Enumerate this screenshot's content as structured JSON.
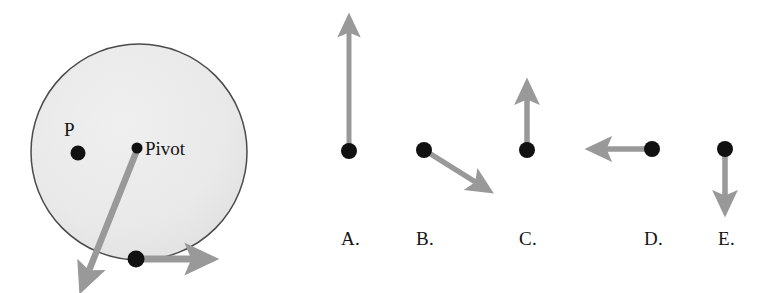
{
  "figure": {
    "type": "physics-rotation-diagram",
    "background_color": "#ffffff",
    "arrow_color": "#999999",
    "dot_color": "#111111",
    "disk": {
      "fill_color": "#eaeaea",
      "stroke_color": "#4a4a4a",
      "center_x": 139,
      "center_y": 152,
      "radius": 108
    },
    "labels": {
      "point_p": "P",
      "pivot": "Pivot"
    },
    "points": [
      {
        "name": "P",
        "x": 78,
        "y": 153
      },
      {
        "name": "Pivot",
        "x": 137,
        "y": 148
      },
      {
        "name": "rim-point",
        "x": 136,
        "y": 259
      }
    ],
    "vectors": [
      {
        "name": "rim-tangential-arrow",
        "x1": 139,
        "y1": 259,
        "x2": 212,
        "y2": 259,
        "direction": "right"
      },
      {
        "name": "pivot-diagonal-arrow",
        "x1": 137,
        "y1": 150,
        "x2": 84,
        "y2": 283,
        "direction": "down-left"
      }
    ]
  },
  "options": [
    {
      "label": "A.",
      "label_x": 341,
      "label_y": 229,
      "dot_x": 349,
      "dot_y": 151,
      "arrow": {
        "x1": 349,
        "y1": 145,
        "x2": 349,
        "y2": 14,
        "direction": "up"
      }
    },
    {
      "label": "B.",
      "label_x": 416,
      "label_y": 229,
      "dot_x": 424,
      "dot_y": 150,
      "arrow": {
        "x1": 429,
        "y1": 153,
        "x2": 494,
        "y2": 193,
        "direction": "down-right"
      }
    },
    {
      "label": "C.",
      "label_x": 519,
      "label_y": 229,
      "dot_x": 527,
      "dot_y": 150,
      "arrow": {
        "x1": 527,
        "y1": 144,
        "x2": 527,
        "y2": 80,
        "direction": "up"
      }
    },
    {
      "label": "D.",
      "label_x": 644,
      "label_y": 229,
      "dot_x": 652,
      "dot_y": 149,
      "arrow": {
        "x1": 646,
        "y1": 149,
        "x2": 586,
        "y2": 149,
        "direction": "left"
      }
    },
    {
      "label": "E.",
      "label_x": 718,
      "label_y": 229,
      "dot_x": 725,
      "dot_y": 149,
      "arrow": {
        "x1": 725,
        "y1": 155,
        "x2": 725,
        "y2": 215,
        "direction": "down"
      }
    }
  ]
}
